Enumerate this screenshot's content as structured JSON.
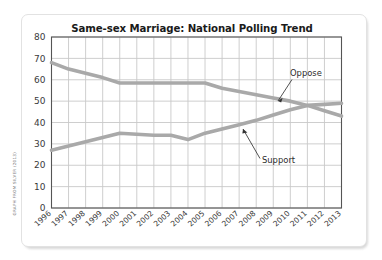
{
  "credit": "GRAPH FROM SILVER (2013)",
  "colors": {
    "line": "#a9a9a9",
    "grid": "#c8c8c8",
    "axis": "#555555",
    "text": "#2b2b2b",
    "card": "#ffffff",
    "page": "#ffffff"
  },
  "chart_data": {
    "type": "line",
    "title": "Same-sex Marriage: National Polling Trend",
    "xlabel": "",
    "ylabel": "",
    "ylim": [
      0,
      80
    ],
    "ytick_step": 10,
    "yticks": [
      "0",
      "10",
      "20",
      "30",
      "40",
      "50",
      "60",
      "70",
      "80"
    ],
    "grid": true,
    "legend_position": "inline-annotations",
    "categories": [
      "1996",
      "1997",
      "1998",
      "1999",
      "2000",
      "2001",
      "2002",
      "2003",
      "2004",
      "2005",
      "2006",
      "2007",
      "2008",
      "2009",
      "2010",
      "2011",
      "2012",
      "2013"
    ],
    "series": [
      {
        "name": "Oppose",
        "values": [
          68,
          65,
          63,
          61,
          58.5,
          58.5,
          58.5,
          58.5,
          58.5,
          58.5,
          56,
          54.5,
          53,
          51.5,
          50,
          48,
          45.5,
          43
        ]
      },
      {
        "name": "Support",
        "values": [
          27,
          29,
          31,
          33,
          35,
          34.5,
          34,
          34,
          32,
          35,
          37,
          39,
          41,
          43.5,
          46,
          48,
          48.5,
          49
        ]
      }
    ],
    "annotations": [
      {
        "label": "Oppose",
        "series": "Oppose"
      },
      {
        "label": "Support",
        "series": "Support"
      }
    ]
  }
}
